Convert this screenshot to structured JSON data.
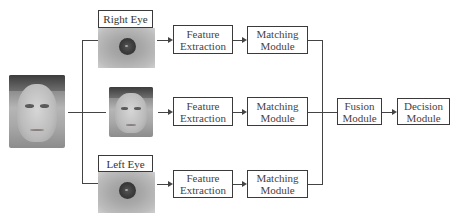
{
  "diagram": {
    "type": "multimodal-biometric-pipeline",
    "inputs": {
      "source_face": {
        "description": "face photo (grayscale)"
      },
      "right_eye": {
        "label": "Right Eye"
      },
      "face_crop": {
        "description": "cropped face photo"
      },
      "left_eye": {
        "label": "Left Eye"
      }
    },
    "rows": [
      {
        "feature": "Feature\nExtraction",
        "feature_l1": "Feature",
        "feature_l2": "Extraction",
        "match_l1": "Matching",
        "match_l2": "Module"
      },
      {
        "feature_l1": "Feature",
        "feature_l2": "Extraction",
        "match_l1": "Matching",
        "match_l2": "Module"
      },
      {
        "feature_l1": "Feature",
        "feature_l2": "Extraction",
        "match_l1": "Matching",
        "match_l2": "Module"
      }
    ],
    "fusion": {
      "l1": "Fusion",
      "l2": "Module"
    },
    "decision": {
      "l1": "Decision",
      "l2": "Module"
    },
    "colors": {
      "line": "#444444",
      "box_border": "#3a3a3a",
      "text": "#444444"
    }
  }
}
